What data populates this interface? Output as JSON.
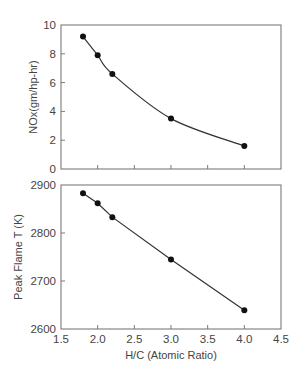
{
  "chart_data": [
    {
      "type": "line",
      "title": "",
      "xlabel": "",
      "ylabel": "NOx(gm/hp-hr)",
      "xlim": [
        1.5,
        4.5
      ],
      "ylim": [
        0,
        10
      ],
      "yticks": [
        0,
        2,
        4,
        6,
        8,
        10
      ],
      "yticklabels": [
        "0",
        "2",
        "4",
        "6",
        "8",
        "10"
      ],
      "xticks": [
        1.5,
        2.0,
        2.5,
        3.0,
        3.5,
        4.0,
        4.5
      ],
      "xticklabels_visible": false,
      "grid": false,
      "series": [
        {
          "name": "NOx",
          "x": [
            1.8,
            2.0,
            2.2,
            3.0,
            4.0
          ],
          "values": [
            9.2,
            7.9,
            6.6,
            3.5,
            1.6
          ],
          "marker": "circle",
          "smooth": true
        }
      ]
    },
    {
      "type": "line",
      "title": "",
      "xlabel": "H/C (Atomic Ratio)",
      "ylabel": "Peak Flame T (K)",
      "xlim": [
        1.5,
        4.5
      ],
      "ylim": [
        2600,
        2900
      ],
      "yticks": [
        2600,
        2700,
        2800,
        2900
      ],
      "yticklabels": [
        "2600",
        "2700",
        "2800",
        "2900"
      ],
      "xticks": [
        1.5,
        2.0,
        2.5,
        3.0,
        3.5,
        4.0,
        4.5
      ],
      "xticklabels": [
        "1.5",
        "2.0",
        "2.5",
        "3.0",
        "3.5",
        "4.0",
        "4.5"
      ],
      "grid": false,
      "series": [
        {
          "name": "Peak Flame T",
          "x": [
            1.8,
            2.0,
            2.2,
            3.0,
            4.0
          ],
          "values": [
            2883,
            2862,
            2833,
            2745,
            2639
          ],
          "marker": "circle",
          "smooth": false
        }
      ]
    }
  ]
}
